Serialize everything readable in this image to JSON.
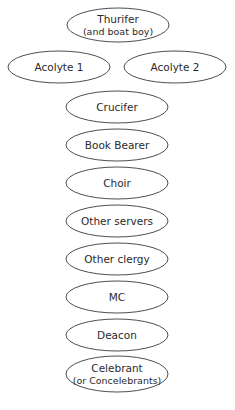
{
  "diagram": {
    "type": "procession-order",
    "stroke_color": "#3a3a3a",
    "text_color": "#2a2a2a",
    "nodes": [
      {
        "id": "thurifer",
        "label": "Thurifer",
        "sublabel": "(and boat boy)",
        "cx": 118,
        "cy": 25,
        "rx": 51,
        "ry": 17
      },
      {
        "id": "acolyte-1",
        "label": "Acolyte 1",
        "cx": 59,
        "cy": 67,
        "rx": 51,
        "ry": 16
      },
      {
        "id": "acolyte-2",
        "label": "Acolyte 2",
        "cx": 175,
        "cy": 67,
        "rx": 51,
        "ry": 16
      },
      {
        "id": "crucifer",
        "label": "Crucifer",
        "cx": 117,
        "cy": 107,
        "rx": 51,
        "ry": 16
      },
      {
        "id": "book-bearer",
        "label": "Book Bearer",
        "cx": 117,
        "cy": 145,
        "rx": 51,
        "ry": 16
      },
      {
        "id": "choir",
        "label": "Choir",
        "cx": 117,
        "cy": 183,
        "rx": 51,
        "ry": 16
      },
      {
        "id": "other-servers",
        "label": "Other servers",
        "cx": 117,
        "cy": 221,
        "rx": 51,
        "ry": 16
      },
      {
        "id": "other-clergy",
        "label": "Other clergy",
        "cx": 117,
        "cy": 259,
        "rx": 51,
        "ry": 16
      },
      {
        "id": "mc",
        "label": "MC",
        "cx": 117,
        "cy": 297,
        "rx": 51,
        "ry": 16
      },
      {
        "id": "deacon",
        "label": "Deacon",
        "cx": 117,
        "cy": 335,
        "rx": 51,
        "ry": 16
      },
      {
        "id": "celebrant",
        "label": "Celebrant",
        "sublabel": "(or Concelebrants)",
        "cx": 117,
        "cy": 374,
        "rx": 51,
        "ry": 18
      }
    ]
  }
}
